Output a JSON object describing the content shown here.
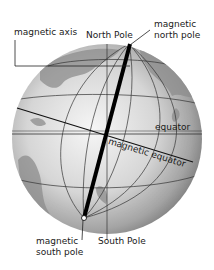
{
  "labels": {
    "magnetic_axis": "magnetic axis",
    "north_pole": "North Pole",
    "magnetic_north_pole_line1": "magnetic",
    "magnetic_north_pole_line2": "north pole",
    "equator": "equator",
    "magnetic_equator": "magnetic equator",
    "magnetic_south_pole_line1": "magnetic",
    "magnetic_south_pole_line2": "south pole",
    "south_pole": "South Pole"
  },
  "colors": {
    "globe_light": "#f4f4f4",
    "globe_mid": "#b8b8b8",
    "globe_dark": "#6e6e6e",
    "land": "#8a8a8a",
    "grid_line": "#333333",
    "axis": "#000000",
    "text": "#1a1a1a"
  }
}
